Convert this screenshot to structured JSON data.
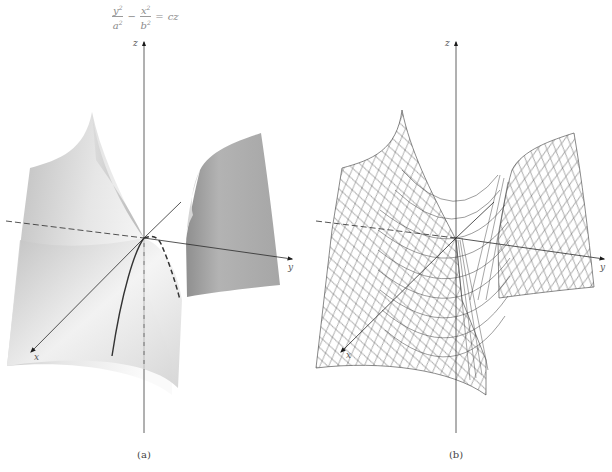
{
  "equation": {
    "term1_num": "y",
    "term1_den": "a",
    "term2_num": "x",
    "term2_den": "b",
    "exponent": "2",
    "minus": "−",
    "equals": "=",
    "rhs": "cz",
    "full_text": "y²/a² − x²/b² = cz"
  },
  "panels": [
    {
      "id": "a",
      "caption": "(a)",
      "style": "shaded surface",
      "axes": {
        "x": "x",
        "y": "y",
        "z": "z"
      },
      "traces": [
        "solid parabola in xz-plane opening downward along x",
        "dashed parabola in yz-plane behind origin"
      ]
    },
    {
      "id": "b",
      "caption": "(b)",
      "style": "wireframe mesh",
      "axes": {
        "x": "x",
        "y": "y",
        "z": "z"
      }
    }
  ],
  "colors": {
    "surface_light": "#f4f4f4",
    "surface_mid": "#c9c9c9",
    "surface_dark": "#9d9d9d",
    "axis": "#2a2a2a",
    "mesh": "#3a3a3a",
    "equation_text": "#8a8a8a"
  }
}
